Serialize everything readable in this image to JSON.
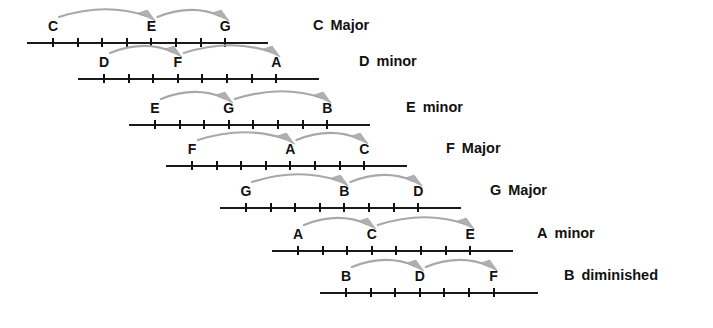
{
  "diagram": {
    "line_color": "#111111",
    "arc_color": "#a8a8a8",
    "tick_spacing": 24.6,
    "rows": [
      {
        "chord_root": "C",
        "chord_quality": "Major",
        "line_left": 27,
        "line_width": 241,
        "row_top": 4,
        "tick_count": 8,
        "first_tick_offset": 25,
        "notes": [
          {
            "label": "C",
            "tick_index": 0
          },
          {
            "label": "E",
            "tick_index": 4
          },
          {
            "label": "G",
            "tick_index": 7
          }
        ],
        "arcs": [
          {
            "from_tick": 0,
            "to_tick": 4
          },
          {
            "from_tick": 4,
            "to_tick": 7
          }
        ],
        "chord_name_x": 313
      },
      {
        "chord_root": "D",
        "chord_quality": "minor",
        "line_left": 78,
        "line_width": 241,
        "row_top": 40,
        "tick_count": 8,
        "first_tick_offset": 25,
        "notes": [
          {
            "label": "D",
            "tick_index": 0
          },
          {
            "label": "F",
            "tick_index": 3
          },
          {
            "label": "A",
            "tick_index": 7
          }
        ],
        "arcs": [
          {
            "from_tick": 0,
            "to_tick": 3
          },
          {
            "from_tick": 3,
            "to_tick": 7
          }
        ],
        "chord_name_x": 359
      },
      {
        "chord_root": "E",
        "chord_quality": "minor",
        "line_left": 129,
        "line_width": 241,
        "row_top": 86,
        "tick_count": 8,
        "first_tick_offset": 25,
        "notes": [
          {
            "label": "E",
            "tick_index": 0
          },
          {
            "label": "G",
            "tick_index": 3
          },
          {
            "label": "B",
            "tick_index": 7
          }
        ],
        "arcs": [
          {
            "from_tick": 0,
            "to_tick": 3
          },
          {
            "from_tick": 3,
            "to_tick": 7
          }
        ],
        "chord_name_x": 406
      },
      {
        "chord_root": "F",
        "chord_quality": "Major",
        "line_left": 166,
        "line_width": 241,
        "row_top": 127,
        "tick_count": 8,
        "first_tick_offset": 25,
        "notes": [
          {
            "label": "F",
            "tick_index": 0
          },
          {
            "label": "A",
            "tick_index": 4
          },
          {
            "label": "C",
            "tick_index": 7
          }
        ],
        "arcs": [
          {
            "from_tick": 0,
            "to_tick": 4
          },
          {
            "from_tick": 4,
            "to_tick": 7
          }
        ],
        "chord_name_x": 446
      },
      {
        "chord_root": "G",
        "chord_quality": "Major",
        "line_left": 220,
        "line_width": 241,
        "row_top": 169,
        "tick_count": 8,
        "first_tick_offset": 25,
        "notes": [
          {
            "label": "G",
            "tick_index": 0
          },
          {
            "label": "B",
            "tick_index": 4
          },
          {
            "label": "D",
            "tick_index": 7
          }
        ],
        "arcs": [
          {
            "from_tick": 0,
            "to_tick": 4
          },
          {
            "from_tick": 4,
            "to_tick": 7
          }
        ],
        "chord_name_x": 490
      },
      {
        "chord_root": "A",
        "chord_quality": "minor",
        "line_left": 272,
        "line_width": 241,
        "row_top": 212,
        "tick_count": 8,
        "first_tick_offset": 25,
        "notes": [
          {
            "label": "A",
            "tick_index": 0
          },
          {
            "label": "C",
            "tick_index": 3
          },
          {
            "label": "E",
            "tick_index": 7
          }
        ],
        "arcs": [
          {
            "from_tick": 0,
            "to_tick": 3
          },
          {
            "from_tick": 3,
            "to_tick": 7
          }
        ],
        "chord_name_x": 537
      },
      {
        "chord_root": "B",
        "chord_quality": "diminished",
        "line_left": 320,
        "line_width": 218,
        "row_top": 254,
        "tick_count": 7,
        "first_tick_offset": 25,
        "notes": [
          {
            "label": "B",
            "tick_index": 0
          },
          {
            "label": "D",
            "tick_index": 3
          },
          {
            "label": "F",
            "tick_index": 6
          }
        ],
        "arcs": [
          {
            "from_tick": 0,
            "to_tick": 3
          },
          {
            "from_tick": 3,
            "to_tick": 6
          }
        ],
        "chord_name_x": 564
      }
    ]
  }
}
